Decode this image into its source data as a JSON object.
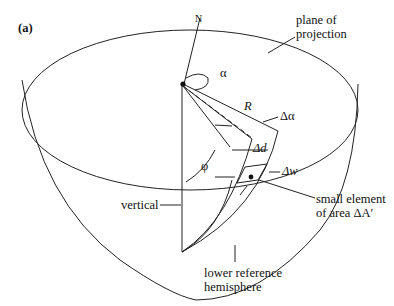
{
  "figure": {
    "panel_label": "(a)",
    "labels": {
      "north": "N",
      "azimuth": "α",
      "radius": "R",
      "delta_alpha": "Δα",
      "delta_d": "Δd",
      "delta_w": "Δw",
      "dip": "φ",
      "vertical": "vertical",
      "plane_line1": "plane of",
      "plane_line2": "projection",
      "element_line1": "small element",
      "element_line2": "of area ΔA′",
      "hemisphere_line1": "lower reference",
      "hemisphere_line2": "hemisphere"
    },
    "colors": {
      "line": "#222222",
      "background": "#ffffff"
    }
  }
}
